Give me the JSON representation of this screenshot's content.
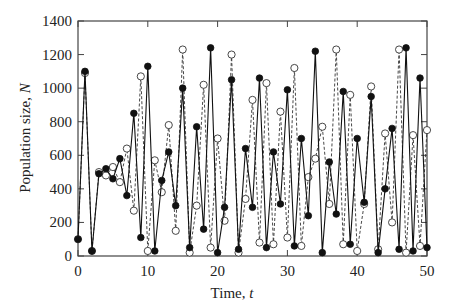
{
  "chart_data": {
    "type": "line",
    "title": "",
    "xlabel": "Time, t",
    "ylabel": "Population size, N",
    "xlim": [
      0,
      50
    ],
    "ylim": [
      0,
      1400
    ],
    "xticks": [
      0,
      10,
      20,
      30,
      40,
      50
    ],
    "yticks": [
      0,
      200,
      400,
      600,
      800,
      1000,
      1200,
      1400
    ],
    "grid": false,
    "legend": "none",
    "x": [
      0,
      1,
      2,
      3,
      4,
      5,
      6,
      7,
      8,
      9,
      10,
      11,
      12,
      13,
      14,
      15,
      16,
      17,
      18,
      19,
      20,
      21,
      22,
      23,
      24,
      25,
      26,
      27,
      28,
      29,
      30,
      31,
      32,
      33,
      34,
      35,
      36,
      37,
      38,
      39,
      40,
      41,
      42,
      43,
      44,
      45,
      46,
      47,
      48,
      49,
      50
    ],
    "series": [
      {
        "name": "filled markers, solid line",
        "marker": "filled-circle",
        "line": "solid",
        "values": [
          100,
          1100,
          30,
          490,
          520,
          460,
          580,
          360,
          850,
          110,
          1130,
          30,
          450,
          620,
          300,
          1000,
          50,
          770,
          160,
          1240,
          20,
          290,
          1050,
          40,
          640,
          290,
          1060,
          50,
          620,
          310,
          990,
          60,
          700,
          240,
          1220,
          20,
          560,
          250,
          980,
          70,
          700,
          320,
          950,
          20,
          400,
          760,
          40,
          1240,
          30,
          1060,
          50
        ]
      },
      {
        "name": "open markers, dashed line",
        "marker": "open-circle",
        "line": "dashed",
        "values": [
          100,
          1090,
          30,
          500,
          480,
          530,
          440,
          640,
          270,
          1070,
          30,
          570,
          380,
          780,
          150,
          1230,
          20,
          300,
          1020,
          50,
          700,
          210,
          1200,
          20,
          340,
          930,
          80,
          1030,
          70,
          860,
          110,
          1120,
          60,
          470,
          580,
          770,
          310,
          1230,
          70,
          960,
          30,
          310,
          1010,
          40,
          730,
          200,
          1230,
          20,
          720,
          60,
          750
        ]
      }
    ]
  },
  "labels": {
    "xlabel_text": "Time, ",
    "xlabel_var": "t",
    "ylabel_text": "Population size, ",
    "ylabel_var": "N"
  },
  "colors": {
    "filled": "#111111",
    "open_stroke": "#333333",
    "axis": "#444444"
  }
}
